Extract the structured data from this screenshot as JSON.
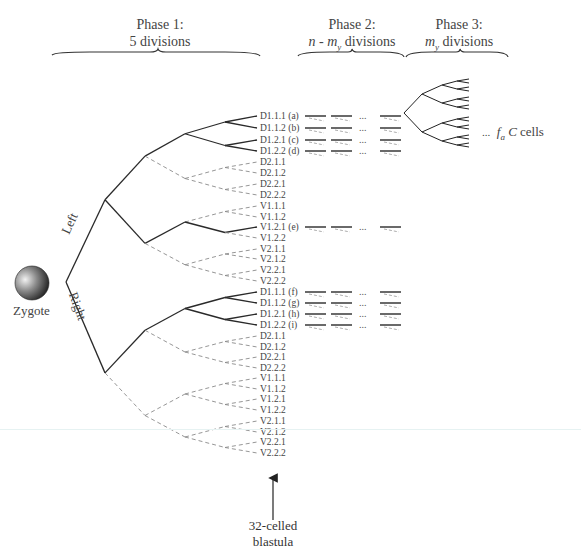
{
  "phases": [
    {
      "title": "Phase 1:",
      "subtitle": "5 divisions"
    },
    {
      "title": "Phase 2:",
      "subtitle_parts": [
        "n",
        " - ",
        "m",
        "y",
        " divisions"
      ]
    },
    {
      "title": "Phase 3:",
      "subtitle_parts": [
        "m",
        "y",
        " divisions"
      ]
    }
  ],
  "zygote": {
    "label": "Zygote"
  },
  "branches": {
    "left": "Left",
    "right": "Right"
  },
  "phase3": {
    "ellipsis": "...",
    "label_f": "f",
    "label_sub": "a",
    "label_c": "C",
    "label_rest": " cells"
  },
  "blastula": {
    "line1": "32-celled",
    "line2": "blastula"
  },
  "ellipsis": "...",
  "left_leaves": [
    {
      "label": "D1.1.1 (a)",
      "active": true
    },
    {
      "label": "D1.1.2 (b)",
      "active": true
    },
    {
      "label": "D1.2.1 (c)",
      "active": true
    },
    {
      "label": "D1.2.2 (d)",
      "active": true
    },
    {
      "label": "D2.1.1",
      "active": false
    },
    {
      "label": "D2.1.2",
      "active": false
    },
    {
      "label": "D2.2.1",
      "active": false
    },
    {
      "label": "D2.2.2",
      "active": false
    },
    {
      "label": "V1.1.1",
      "active": false
    },
    {
      "label": "V1.1.2",
      "active": false
    },
    {
      "label": "V1.2.1 (e)",
      "active": true
    },
    {
      "label": "V1.2.2",
      "active": false
    },
    {
      "label": "V2.1.1",
      "active": false
    },
    {
      "label": "V2.1.2",
      "active": false
    },
    {
      "label": "V2.2.1",
      "active": false
    },
    {
      "label": "V2.2.2",
      "active": false
    }
  ],
  "right_leaves": [
    {
      "label": "D1.1.1 (f)",
      "active": true
    },
    {
      "label": "D1.1.2 (g)",
      "active": true
    },
    {
      "label": "D1.2.1 (h)",
      "active": true
    },
    {
      "label": "D1.2.2 (i)",
      "active": true
    },
    {
      "label": "D2.1.1",
      "active": false
    },
    {
      "label": "D2.1.2",
      "active": false
    },
    {
      "label": "D2.2.1",
      "active": false
    },
    {
      "label": "D2.2.2",
      "active": false
    },
    {
      "label": "V1.1.1",
      "active": false
    },
    {
      "label": "V1.1.2",
      "active": false
    },
    {
      "label": "V1.2.1",
      "active": false
    },
    {
      "label": "V1.2.2",
      "active": false
    },
    {
      "label": "V2.1.1",
      "active": false
    },
    {
      "label": "V2.1.2",
      "active": false
    },
    {
      "label": "V2.2.1",
      "active": false
    },
    {
      "label": "V2.2.2",
      "active": false
    }
  ],
  "colors": {
    "line": "#2a2a2a",
    "dashed": "#8a8a8a",
    "text": "#444444"
  }
}
